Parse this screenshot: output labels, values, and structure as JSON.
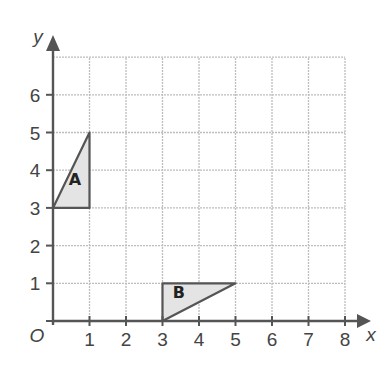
{
  "chart_data": {
    "type": "coordinate-grid",
    "title": "",
    "xlabel": "x",
    "ylabel": "y",
    "origin_label": "O",
    "xlim": [
      0,
      8
    ],
    "ylim": [
      0,
      7
    ],
    "grid": true,
    "x_ticks": [
      "1",
      "2",
      "3",
      "4",
      "5",
      "6",
      "7",
      "8"
    ],
    "y_ticks": [
      "1",
      "2",
      "3",
      "4",
      "5",
      "6"
    ],
    "shapes": [
      {
        "name": "A",
        "type": "triangle",
        "vertices": [
          [
            0,
            3
          ],
          [
            1,
            3
          ],
          [
            1,
            5
          ]
        ],
        "label_at": [
          0.6,
          3.6
        ]
      },
      {
        "name": "B",
        "type": "triangle",
        "vertices": [
          [
            3,
            0
          ],
          [
            3,
            1
          ],
          [
            5,
            1
          ]
        ],
        "label_at": [
          3.45,
          0.6
        ]
      }
    ],
    "colors": {
      "axis": "#555555",
      "grid": "#bdbdbd",
      "shape_fill": "#e4e4e4",
      "shape_stroke": "#555555"
    }
  }
}
